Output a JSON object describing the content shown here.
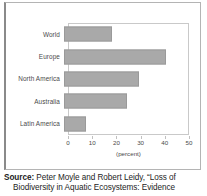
{
  "chart_data": {
    "type": "bar",
    "orientation": "horizontal",
    "title": "",
    "categories": [
      "World",
      "Europe",
      "North America",
      "Australia",
      "Latin America"
    ],
    "values": [
      20,
      42,
      31,
      26,
      9
    ],
    "series": [
      {
        "name": "Percent of fish species threatened or extinct",
        "values": [
          20,
          42,
          31,
          26,
          9
        ]
      }
    ],
    "xlabel": "(percent)",
    "ylabel": "",
    "xlim": [
      0,
      50
    ],
    "xticks": [
      0,
      10,
      20,
      30,
      40,
      50
    ],
    "xtick_labels": [
      "0",
      "10",
      "20",
      "30",
      "40",
      "50"
    ],
    "grid": false,
    "legend": false,
    "bar_color": "#a9a9a9"
  },
  "figure": {
    "axis_title": "(percent)"
  },
  "source": {
    "label": "Source:",
    "line1": " Peter Moyle and Robert Leidy, “Loss of",
    "line2": "Biodiversity in Aquatic Ecosystems: Evidence"
  },
  "colors": {
    "bar": "#a9a9a9",
    "frame": "#b4b4b4",
    "plot_border": "#c9c9c9",
    "text": "#4a4a4a"
  }
}
